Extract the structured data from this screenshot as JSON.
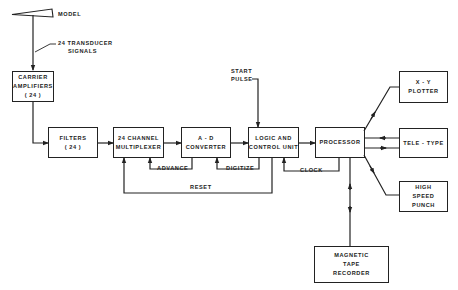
{
  "diagram": {
    "type": "block-diagram",
    "colors": {
      "line": "#222222",
      "background": "#ffffff"
    },
    "nodes": {
      "model": {
        "label": "MODEL"
      },
      "carrier": {
        "line1": "CARRIER",
        "line2": "AMPLIFIERS",
        "line3": "( 24 )"
      },
      "filters": {
        "line1": "FILTERS",
        "line2": "( 24 )"
      },
      "multiplexer": {
        "line1": "24 CHANNEL",
        "line2": "MULTIPLEXER"
      },
      "adc": {
        "line1": "A - D",
        "line2": "CONVERTER"
      },
      "logic": {
        "line1": "LOGIC AND",
        "line2": "CONTROL UNIT"
      },
      "processor": {
        "line1": "PROCESSOR"
      },
      "plotter": {
        "line1": "X - Y",
        "line2": "PLOTTER"
      },
      "teletype": {
        "line1": "TELE - TYPE"
      },
      "punch": {
        "line1": "HIGH",
        "line2": "SPEED",
        "line3": "PUNCH"
      },
      "tape": {
        "line1": "MAGNETIC",
        "line2": "TAPE",
        "line3": "RECORDER"
      }
    },
    "edge_labels": {
      "transducer_1": "24 TRANSDUCER",
      "transducer_2": "SIGNALS",
      "start_1": "START",
      "start_2": "PULSE",
      "advance": "ADVANCE",
      "digitize": "DIGITIZE",
      "clock": "CLOCK",
      "reset": "RESET"
    },
    "edges": [
      {
        "from": "model",
        "to": "carrier",
        "label": "24 TRANSDUCER SIGNALS"
      },
      {
        "from": "carrier",
        "to": "filters"
      },
      {
        "from": "filters",
        "to": "multiplexer"
      },
      {
        "from": "multiplexer",
        "to": "adc"
      },
      {
        "from": "adc",
        "to": "logic"
      },
      {
        "from": "logic",
        "to": "processor"
      },
      {
        "from": "start",
        "to": "logic",
        "label": "START PULSE"
      },
      {
        "from": "adc",
        "to": "multiplexer",
        "label": "ADVANCE"
      },
      {
        "from": "logic",
        "to": "adc",
        "label": "DIGITIZE"
      },
      {
        "from": "processor",
        "to": "logic",
        "label": "CLOCK"
      },
      {
        "from": "logic",
        "to": "multiplexer",
        "label": "RESET"
      },
      {
        "from": "processor",
        "to": "plotter"
      },
      {
        "from": "processor",
        "to": "teletype",
        "bidirectional": true
      },
      {
        "from": "processor",
        "to": "punch"
      },
      {
        "from": "processor",
        "to": "tape",
        "bidirectional": true
      }
    ]
  }
}
